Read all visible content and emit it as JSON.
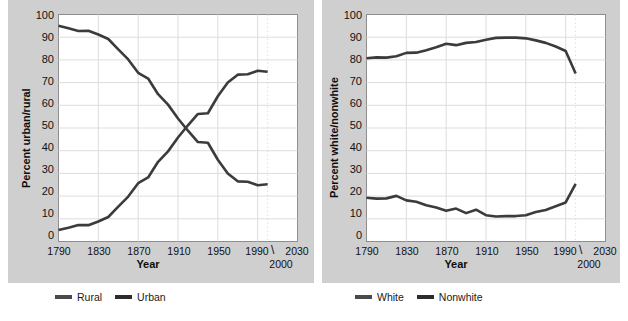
{
  "chart_data": [
    {
      "type": "line",
      "panel": "left",
      "title": "",
      "xlabel": "Year",
      "ylabel": "Percent urban/rural",
      "xlim": [
        1790,
        2030
      ],
      "ylim": [
        0,
        100
      ],
      "grid": true,
      "legend_position": "bottom",
      "xticks": [
        "1790",
        "1830",
        "1870",
        "1910",
        "1950",
        "1990",
        "2030"
      ],
      "xtick_values": [
        1790,
        1830,
        1870,
        1910,
        1950,
        1990,
        2030
      ],
      "xtick_annotation": "2000",
      "xtick_annotation_mark": "\\",
      "yticks": [
        "0",
        "10",
        "20",
        "30",
        "40",
        "50",
        "60",
        "70",
        "80",
        "90",
        "100"
      ],
      "ytick_values": [
        0,
        10,
        20,
        30,
        40,
        50,
        60,
        70,
        80,
        90,
        100
      ],
      "x": [
        1790,
        1800,
        1810,
        1820,
        1830,
        1840,
        1850,
        1860,
        1870,
        1880,
        1890,
        1900,
        1910,
        1920,
        1930,
        1940,
        1950,
        1960,
        1970,
        1980,
        1990,
        2000
      ],
      "series": [
        {
          "name": "Rural",
          "color": "#3b3b3b",
          "values": [
            95,
            93.9,
            92.7,
            92.8,
            91.2,
            89.2,
            84.6,
            80.2,
            74.3,
            71.8,
            64.9,
            60.3,
            54.2,
            48.8,
            43.8,
            43.5,
            36,
            30,
            26.5,
            26.3,
            24.8,
            25.2
          ]
        },
        {
          "name": "Urban",
          "color": "#3b3b3b",
          "values": [
            5.1,
            6.1,
            7.3,
            7.2,
            8.8,
            10.8,
            15.4,
            19.8,
            25.7,
            28.2,
            35.1,
            39.7,
            45.8,
            51.2,
            56.2,
            56.5,
            64,
            70,
            73.5,
            73.7,
            75.2,
            74.8
          ]
        }
      ],
      "legend": [
        {
          "label": "Rural",
          "color": "#4a4a4a"
        },
        {
          "label": "Urban",
          "color": "#2c2c2c"
        }
      ]
    },
    {
      "type": "line",
      "panel": "right",
      "title": "",
      "xlabel": "Year",
      "ylabel": "Percent white/nonwhite",
      "xlim": [
        1790,
        2030
      ],
      "ylim": [
        0,
        100
      ],
      "grid": true,
      "legend_position": "bottom",
      "xticks": [
        "1790",
        "1830",
        "1870",
        "1910",
        "1950",
        "1990",
        "2030"
      ],
      "xtick_values": [
        1790,
        1830,
        1870,
        1910,
        1950,
        1990,
        2030
      ],
      "xtick_annotation": "2000",
      "xtick_annotation_mark": "\\",
      "yticks": [
        "0",
        "10",
        "20",
        "30",
        "40",
        "50",
        "60",
        "70",
        "80",
        "90",
        "100"
      ],
      "ytick_values": [
        0,
        10,
        20,
        30,
        40,
        50,
        60,
        70,
        80,
        90,
        100
      ],
      "x": [
        1790,
        1800,
        1810,
        1820,
        1830,
        1840,
        1850,
        1860,
        1870,
        1880,
        1890,
        1900,
        1910,
        1920,
        1930,
        1940,
        1950,
        1960,
        1970,
        1980,
        1990,
        2000
      ],
      "series": [
        {
          "name": "White",
          "color": "#3b3b3b",
          "values": [
            80.7,
            81.1,
            81,
            81.6,
            83.1,
            83.2,
            84.3,
            85.6,
            87.1,
            86.5,
            87.5,
            87.9,
            88.9,
            89.7,
            89.8,
            89.8,
            89.5,
            88.6,
            87.5,
            85.9,
            83.9,
            74
          ]
        },
        {
          "name": "Nonwhite",
          "color": "#3b3b3b",
          "values": [
            19.3,
            18.9,
            19,
            20.1,
            18.1,
            17.5,
            16,
            15,
            13.5,
            14.5,
            12.5,
            14,
            11.6,
            11,
            11.2,
            11.2,
            11.6,
            13,
            13.9,
            15.5,
            17.2,
            25.4
          ]
        }
      ],
      "legend": [
        {
          "label": "White",
          "color": "#4a4a4a"
        },
        {
          "label": "Nonwhite",
          "color": "#2c2c2c"
        }
      ]
    }
  ],
  "theme": {
    "page_background": "#ffffff",
    "panel_background": "#cfcfcf",
    "plot_background": "#ffffff",
    "grid_color": "#dddddd",
    "axis_color": "#8e8e8e",
    "text_color": "#111111"
  }
}
